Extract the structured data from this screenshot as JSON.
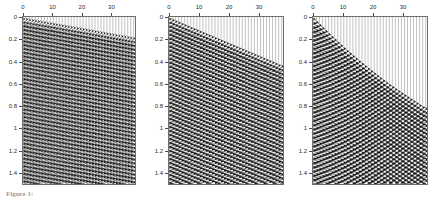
{
  "figure": {
    "caption_prefix": "Figure",
    "caption_number": "1:",
    "caption_text": ""
  },
  "chart_data": [
    {
      "type": "area",
      "panel_index": 1,
      "title": "",
      "xlabel": "",
      "ylabel": "",
      "xlim": [
        0,
        38
      ],
      "ylim": [
        1.5,
        0
      ],
      "x_ticks": [
        0,
        10,
        20,
        30
      ],
      "x_tick_labels": [
        "0",
        "10",
        "20",
        "30"
      ],
      "y_ticks": [
        0,
        0.2,
        0.4,
        0.6,
        0.8,
        1,
        1.2,
        1.4
      ],
      "y_tick_labels": [
        "0",
        "0.2",
        "0.4",
        "0.6",
        "0.8",
        "1",
        "1.2",
        "1.4"
      ],
      "grid": false,
      "legend": "none",
      "n_traces": 38,
      "trace_spacing": 1,
      "wavelet_period": 0.034,
      "wavelet_amplitude": 0.62,
      "fill": "variable-area-wiggle",
      "arrival_curve_name": "near-linear moveout",
      "arrival_t0": 0.0,
      "arrival_tmax": 0.175,
      "arrival_curvature": 0.0,
      "arrival_x": [
        0,
        5,
        10,
        15,
        20,
        25,
        30,
        35,
        37
      ],
      "arrival_t": [
        0.0,
        0.024,
        0.047,
        0.071,
        0.094,
        0.118,
        0.142,
        0.165,
        0.175
      ]
    },
    {
      "type": "area",
      "panel_index": 2,
      "title": "",
      "xlabel": "",
      "ylabel": "",
      "xlim": [
        0,
        38
      ],
      "ylim": [
        1.5,
        0
      ],
      "x_ticks": [
        0,
        10,
        20,
        30
      ],
      "x_tick_labels": [
        "0",
        "10",
        "20",
        "30"
      ],
      "y_ticks": [
        0,
        0.2,
        0.4,
        0.6,
        0.8,
        1,
        1.2,
        1.4
      ],
      "y_tick_labels": [
        "0",
        "0.2",
        "0.4",
        "0.6",
        "0.8",
        "1",
        "1.2",
        "1.4"
      ],
      "grid": false,
      "legend": "none",
      "n_traces": 38,
      "trace_spacing": 1,
      "wavelet_period": 0.036,
      "wavelet_amplitude": 0.7,
      "fill": "variable-area-wiggle",
      "arrival_curve_name": "linear moveout",
      "arrival_t0": 0.0,
      "arrival_tmax": 0.425,
      "arrival_curvature": 0.06,
      "arrival_x": [
        0,
        5,
        10,
        15,
        20,
        25,
        30,
        35,
        37
      ],
      "arrival_t": [
        0.0,
        0.058,
        0.115,
        0.172,
        0.229,
        0.286,
        0.343,
        0.4,
        0.425
      ]
    },
    {
      "type": "area",
      "panel_index": 3,
      "title": "",
      "xlabel": "",
      "ylabel": "",
      "xlim": [
        0,
        38
      ],
      "ylim": [
        1.5,
        0
      ],
      "x_ticks": [
        0,
        10,
        20,
        30
      ],
      "x_tick_labels": [
        "0",
        "10",
        "20",
        "30"
      ],
      "y_ticks": [
        0,
        0.2,
        0.4,
        0.6,
        0.8,
        1,
        1.2,
        1.4
      ],
      "y_tick_labels": [
        "0",
        "0.2",
        "0.4",
        "0.6",
        "0.8",
        "1",
        "1.2",
        "1.4"
      ],
      "grid": false,
      "legend": "none",
      "n_traces": 38,
      "trace_spacing": 1,
      "wavelet_period": 0.038,
      "wavelet_amplitude": 0.74,
      "fill": "variable-area-wiggle",
      "arrival_curve_name": "hyperbolic moveout",
      "arrival_t0": 0.0,
      "arrival_tmax": 0.805,
      "arrival_curvature": 0.55,
      "arrival_x": [
        0,
        5,
        10,
        15,
        20,
        25,
        30,
        35,
        37
      ],
      "arrival_t": [
        0.0,
        0.135,
        0.262,
        0.378,
        0.487,
        0.59,
        0.682,
        0.77,
        0.805
      ]
    }
  ]
}
